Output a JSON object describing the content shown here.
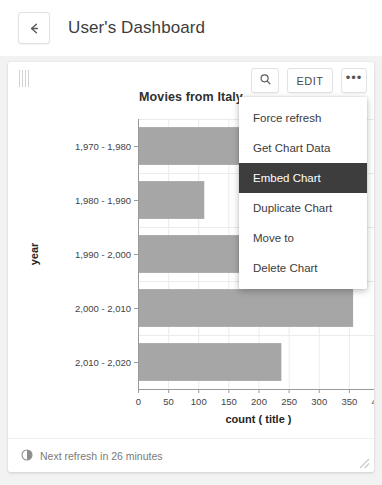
{
  "header": {
    "back_icon": "arrow-left-icon",
    "title": "User's Dashboard"
  },
  "card": {
    "drag_handle_icon": "drag-grip-icon",
    "toolbar": {
      "search_icon": "magnifier-icon",
      "edit_label": "EDIT",
      "more_label": "•••"
    },
    "footer": {
      "refresh_icon": "pie-clock-icon",
      "refresh_text": "Next refresh in 26 minutes",
      "resize_icon": "resize-corner-icon"
    }
  },
  "menu": {
    "items": [
      {
        "label": "Force refresh",
        "selected": false
      },
      {
        "label": "Get Chart Data",
        "selected": false
      },
      {
        "label": "Embed Chart",
        "selected": true
      },
      {
        "label": "Duplicate Chart",
        "selected": false
      },
      {
        "label": "Move to",
        "selected": false
      },
      {
        "label": "Delete Chart",
        "selected": false
      }
    ],
    "highlight_color": "#3d3d3d"
  },
  "chart_data": {
    "type": "bar",
    "orientation": "horizontal",
    "title": "Movies from Italy",
    "xlabel": "count ( title )",
    "ylabel": "year",
    "categories": [
      "1,970 - 1,980",
      "1,980 - 1,990",
      "1,990 - 2,000",
      "2,000 - 2,010",
      "2,010 - 2,020"
    ],
    "values": [
      205,
      110,
      172,
      357,
      238
    ],
    "xlim": [
      0,
      400
    ],
    "xticks": [
      0,
      50,
      100,
      150,
      200,
      250,
      300,
      350,
      400
    ],
    "xticklabels": [
      "0",
      "50",
      "100",
      "150",
      "200",
      "250",
      "300",
      "350",
      "400"
    ],
    "grid": true,
    "legend": false,
    "bar_color": "#a6a6a6"
  }
}
